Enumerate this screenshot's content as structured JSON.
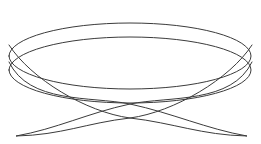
{
  "figure": {
    "title": "",
    "width": 261,
    "height": 144,
    "background_color": "#ffffff",
    "has_axes": false,
    "has_grid": false,
    "has_labels": false,
    "has_legend": false,
    "has_border": false
  },
  "chart_data": {
    "type": "line",
    "title": "",
    "subtitle": "",
    "xlabel": "",
    "ylabel": "",
    "xlim": [
      -1.1,
      1.1
    ],
    "ylim": [
      -1.1,
      1.1
    ],
    "xticks": [],
    "yticks": [],
    "xticklabels": [],
    "yticklabels": [],
    "grid": false,
    "legend": false,
    "legend_position": "none",
    "annotations": [],
    "curve_family": "lissajous",
    "parametric": {
      "x_expression": "cos(t)",
      "y_expression": "sin(2*t + phi)",
      "frequency_ratio_x": 1,
      "frequency_ratio_y": 2,
      "phase_phi_deg": 72,
      "t_start_deg": 0,
      "t_end_deg": 720,
      "samples": 720
    },
    "series": [
      {
        "name": "upper-rim-ellipse",
        "role": "top rim of bowl",
        "stroke_color": "#3b3b3b",
        "stroke_width": 1.0,
        "closed": true,
        "center_px": [
          130,
          56
        ],
        "radius_x_px": 121,
        "radius_y_px": 33,
        "rotation_deg": 0
      },
      {
        "name": "lower-rim-ellipse",
        "role": "second rim offset below",
        "stroke_color": "#3b3b3b",
        "stroke_width": 1.0,
        "closed": true,
        "center_px": [
          130,
          70
        ],
        "radius_x_px": 121,
        "radius_y_px": 33,
        "rotation_deg": 0
      },
      {
        "name": "left-descending-lobe",
        "role": "crossing lobe sweeping to lower-left tip",
        "stroke_color": "#3b3b3b",
        "stroke_width": 1.0,
        "tip_px": [
          16,
          136
        ]
      },
      {
        "name": "right-descending-lobe",
        "role": "crossing lobe sweeping to lower-right tip",
        "stroke_color": "#3b3b3b",
        "stroke_width": 1.0,
        "tip_px": [
          247,
          136
        ]
      }
    ],
    "key_points_px": {
      "top_apex": [
        130,
        12
      ],
      "second_apex": [
        130,
        26
      ],
      "left_extreme": [
        9,
        45
      ],
      "right_extreme": [
        252,
        45
      ],
      "lower_left_extreme": [
        9,
        62
      ],
      "lower_right_extreme": [
        252,
        62
      ],
      "bottom_left_tip": [
        16,
        136
      ],
      "bottom_right_tip": [
        247,
        136
      ],
      "center_crossing_upper": [
        130,
        104
      ],
      "center_crossing_lower": [
        130,
        118
      ],
      "left_crossing": [
        96,
        118
      ],
      "right_crossing": [
        166,
        118
      ]
    },
    "colors": {
      "stroke": "#3b3b3b",
      "background": "#ffffff"
    },
    "stroke_width_px": 1.0,
    "antialiased": true
  }
}
